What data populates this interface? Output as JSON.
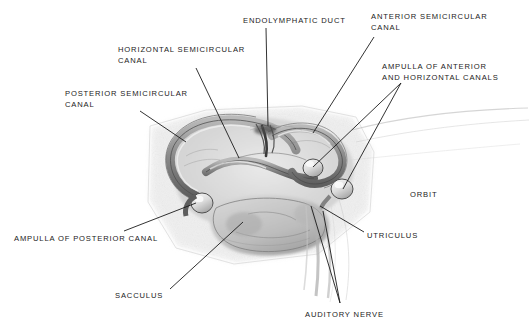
{
  "figure": {
    "background_color": "#ffffff",
    "ink_color": "#1b1b1b",
    "style": "grayscale pencil anatomical illustration with leader-line callouts"
  },
  "labels": [
    {
      "id": "endolymphatic-duct",
      "lines": [
        "ENDOLYMPHATIC DUCT"
      ],
      "x": 243,
      "y": 16,
      "leaders": [
        [
          [
            266,
            28
          ],
          [
            268,
            126
          ]
        ]
      ]
    },
    {
      "id": "anterior-semicircular-canal",
      "lines": [
        "ANTERIOR SEMICIRCULAR",
        "CANAL"
      ],
      "x": 371,
      "y": 12,
      "leaders": [
        [
          [
            374,
            37
          ],
          [
            313,
            133
          ]
        ]
      ]
    },
    {
      "id": "ampulla-of-anterior-and-horizontal-canals",
      "lines": [
        "AMPULLA OF ANTERIOR",
        "AND HORIZONTAL CANALS"
      ],
      "x": 382,
      "y": 62,
      "leaders": [
        [
          [
            401,
            83
          ],
          [
            313,
            167
          ]
        ],
        [
          [
            401,
            83
          ],
          [
            343,
            189
          ]
        ]
      ]
    },
    {
      "id": "horizontal-semicircular-canal",
      "lines": [
        "HORIZONTAL SEMICIRCULAR",
        "CANAL"
      ],
      "x": 118,
      "y": 45,
      "leaders": [
        [
          [
            196,
            68
          ],
          [
            239,
            158
          ]
        ]
      ]
    },
    {
      "id": "posterior-semicircular-canal",
      "lines": [
        "POSTERIOR SEMICIRCULAR",
        "CANAL"
      ],
      "x": 65,
      "y": 89,
      "leaders": [
        [
          [
            140,
            111
          ],
          [
            186,
            142
          ]
        ]
      ]
    },
    {
      "id": "ampulla-of-posterior-canal",
      "lines": [
        "AMPULLA OF POSTERIOR CANAL"
      ],
      "x": 14,
      "y": 234,
      "leaders": [
        [
          [
            124,
            231
          ],
          [
            196,
            203
          ]
        ]
      ]
    },
    {
      "id": "sacculus",
      "lines": [
        "SACCULUS"
      ],
      "x": 115,
      "y": 291,
      "leaders": [
        [
          [
            170,
            289
          ],
          [
            243,
            222
          ]
        ]
      ]
    },
    {
      "id": "auditory-nerve",
      "lines": [
        "AUDITORY NERVE"
      ],
      "x": 305,
      "y": 310,
      "leaders": [
        [
          [
            340,
            303
          ],
          [
            311,
            206
          ]
        ],
        [
          [
            340,
            303
          ],
          [
            323,
            211
          ]
        ]
      ]
    },
    {
      "id": "utriculus",
      "lines": [
        "UTRICULUS"
      ],
      "x": 367,
      "y": 231,
      "leaders": [
        [
          [
            364,
            232
          ],
          [
            320,
            206
          ]
        ]
      ]
    },
    {
      "id": "orbit",
      "lines": [
        "ORBIT"
      ],
      "x": 410,
      "y": 190,
      "leaders": []
    }
  ],
  "structures": [
    "anterior semicircular canal",
    "horizontal semicircular canal",
    "posterior semicircular canal",
    "endolymphatic duct",
    "ampulla of anterior and horizontal canals",
    "ampulla of posterior canal",
    "utriculus",
    "sacculus",
    "auditory nerve"
  ]
}
